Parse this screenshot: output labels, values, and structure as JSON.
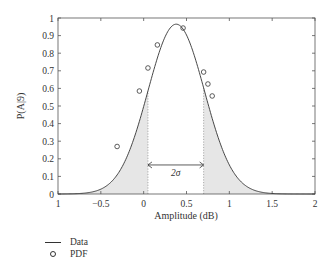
{
  "chart_data": {
    "type": "line",
    "title": "",
    "xlabel": "Amplitude (dB)",
    "ylabel": "P(A|9)",
    "xlim": [
      -1,
      2
    ],
    "ylim": [
      0,
      1
    ],
    "xticks": [
      -1,
      -0.5,
      0,
      0.5,
      1,
      1.5,
      2
    ],
    "xtick_labels": [
      "1",
      "−0.5",
      "0",
      "0.5",
      "1",
      "1.5",
      "2"
    ],
    "yticks": [
      0,
      0.1,
      0.2,
      0.3,
      0.4,
      0.5,
      0.6,
      0.7,
      0.8,
      0.9,
      1
    ],
    "ytick_labels": [
      "0",
      "0.1",
      "0.2",
      "0.3",
      "0.4",
      "0.5",
      "0.6",
      "0.7",
      "0.8",
      "0.9",
      "1"
    ],
    "grid": false,
    "series": [
      {
        "name": "Data",
        "kind": "line",
        "model": "gaussian",
        "mean": 0.38,
        "sigma": 0.33,
        "peak": 0.965
      },
      {
        "name": "PDF",
        "kind": "markers",
        "x": [
          -0.31,
          -0.05,
          0.05,
          0.16,
          0.46,
          0.7,
          0.75,
          0.8
        ],
        "y": [
          0.27,
          0.585,
          0.716,
          0.847,
          0.943,
          0.693,
          0.625,
          0.557
        ]
      }
    ],
    "shaded_regions": [
      {
        "from": -1,
        "to": 0.05,
        "label": "left tail"
      },
      {
        "from": 0.7,
        "to": 2,
        "label": "right tail"
      }
    ],
    "annotations": [
      {
        "text": "2σ",
        "type": "double-arrow",
        "x_from": 0.05,
        "x_to": 0.7,
        "y": 0.165
      }
    ],
    "legend": {
      "placement": "bottom-left-outside",
      "entries": [
        {
          "label": "Data",
          "marker": "line"
        },
        {
          "label": "PDF",
          "marker": "circle"
        }
      ]
    },
    "colors": {
      "line": "#333333",
      "shade": "#e6e6e6",
      "axis": "#555555"
    }
  }
}
